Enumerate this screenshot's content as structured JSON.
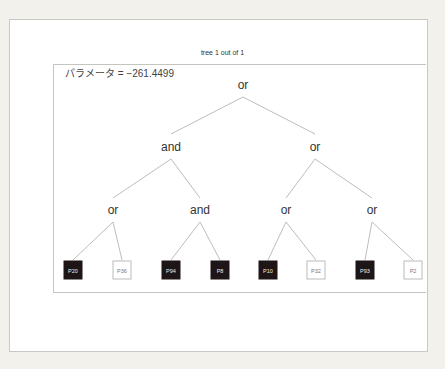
{
  "title": "tree 1 out of 1",
  "parameter_label": "パラメータ = −261.4499",
  "tree": {
    "root": {
      "label": "or",
      "x": 243,
      "y": 85
    },
    "level2": [
      {
        "label": "and",
        "x": 171,
        "y": 147
      },
      {
        "label": "or",
        "x": 315,
        "y": 147
      }
    ],
    "level3": [
      {
        "label": "or",
        "x": 113,
        "y": 210
      },
      {
        "label": "and",
        "x": 200,
        "y": 210
      },
      {
        "label": "or",
        "x": 286,
        "y": 210
      },
      {
        "label": "or",
        "x": 372,
        "y": 210
      }
    ],
    "leaves": [
      {
        "label": "P20",
        "style": "dark",
        "x": 73
      },
      {
        "label": "P36",
        "style": "light",
        "x": 122
      },
      {
        "label": "P94",
        "style": "dark",
        "x": 171
      },
      {
        "label": "P8",
        "style": "dark",
        "x": 220
      },
      {
        "label": "P10",
        "style": "dark",
        "x": 268
      },
      {
        "label": "P32",
        "style": "light",
        "x": 316
      },
      {
        "label": "P93",
        "style": "dark",
        "x": 365
      },
      {
        "label": "P2",
        "style": "light",
        "x": 413
      }
    ]
  },
  "colors": {
    "dark_leaf": "#1e1616",
    "edge": "#bdbdbd"
  }
}
